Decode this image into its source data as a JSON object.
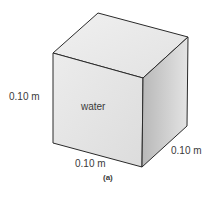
{
  "figure": {
    "caption": "(a)",
    "cube": {
      "content_label": "water",
      "height_label": "0.10 m",
      "width_label": "0.10 m",
      "depth_label": "0.10 m"
    }
  }
}
